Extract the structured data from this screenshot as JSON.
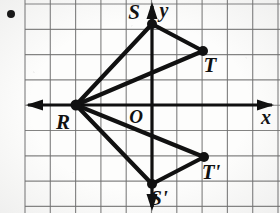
{
  "figure": {
    "background_color": "#fdfdfc",
    "grid": {
      "line_color": "#6f6f6f",
      "spacing_px": 25.3,
      "origin_px": {
        "x": 152,
        "y": 105
      },
      "x_min_px": 25,
      "x_max_px": 280,
      "y_min_px": 4,
      "y_max_px": 213
    },
    "axes": {
      "color": "#101010",
      "x_axis": {
        "label": "x",
        "label_x": 266,
        "label_y": 124,
        "y_px": 105,
        "arrow_left": true,
        "arrow_right": true
      },
      "y_axis": {
        "label": "y",
        "label_x": 164,
        "label_y": 17,
        "x_px": 152,
        "arrow_up": true,
        "arrow_down": true
      },
      "origin_label": "O",
      "origin_label_x": 136,
      "origin_label_y": 123
    },
    "bullet_dot": {
      "x": 11,
      "y": 14,
      "r": 4,
      "color": "#111111"
    },
    "points": [
      {
        "name": "R",
        "label": "R",
        "px": {
          "x": 76,
          "y": 105
        },
        "label_px": {
          "x": 63,
          "y": 129
        },
        "vertex_r": 5.5
      },
      {
        "name": "S",
        "label": "S",
        "px": {
          "x": 152,
          "y": 24
        },
        "label_px": {
          "x": 134,
          "y": 19
        },
        "vertex_r": 5.0
      },
      {
        "name": "T",
        "label": "T",
        "px": {
          "x": 203,
          "y": 51
        },
        "label_px": {
          "x": 210,
          "y": 72
        },
        "vertex_r": 5.0
      },
      {
        "name": "S'",
        "label": "S'",
        "px": {
          "x": 152,
          "y": 184
        },
        "label_px": {
          "x": 159,
          "y": 205
        },
        "vertex_r": 5.0
      },
      {
        "name": "T'",
        "label": "T'",
        "px": {
          "x": 204,
          "y": 157
        },
        "label_px": {
          "x": 211,
          "y": 179
        },
        "vertex_r": 5.0
      }
    ],
    "segments": [
      {
        "name": "R-S",
        "from": "R",
        "to": "S"
      },
      {
        "name": "S-T",
        "from": "S",
        "to": "T"
      },
      {
        "name": "T-R",
        "from": "T",
        "to": "R"
      },
      {
        "name": "R-S'",
        "from": "R",
        "to": "S'"
      },
      {
        "name": "S'-T'",
        "from": "S'",
        "to": "T'"
      },
      {
        "name": "T'-R",
        "from": "T'",
        "to": "R"
      }
    ],
    "stroke_color": "#111111",
    "stroke_width": 4.2
  },
  "chart_data": {
    "type": "scatter",
    "xlabel": "x",
    "ylabel": "y",
    "grid": true,
    "legend": "none",
    "xlim": [
      -5,
      5
    ],
    "ylim": [
      -4,
      4
    ],
    "unit_px": 25.3,
    "series": [
      {
        "name": "Triangle RST",
        "labels": [
          "R",
          "S",
          "T"
        ],
        "x": [
          -3,
          0,
          2
        ],
        "y": [
          0,
          3.2,
          2.1
        ]
      },
      {
        "name": "Triangle R S' T'",
        "labels": [
          "R",
          "S'",
          "T'"
        ],
        "x": [
          -3,
          0,
          2
        ],
        "y": [
          0,
          -3.1,
          -2.1
        ]
      }
    ],
    "annotations": [
      "O",
      "x",
      "y"
    ]
  }
}
